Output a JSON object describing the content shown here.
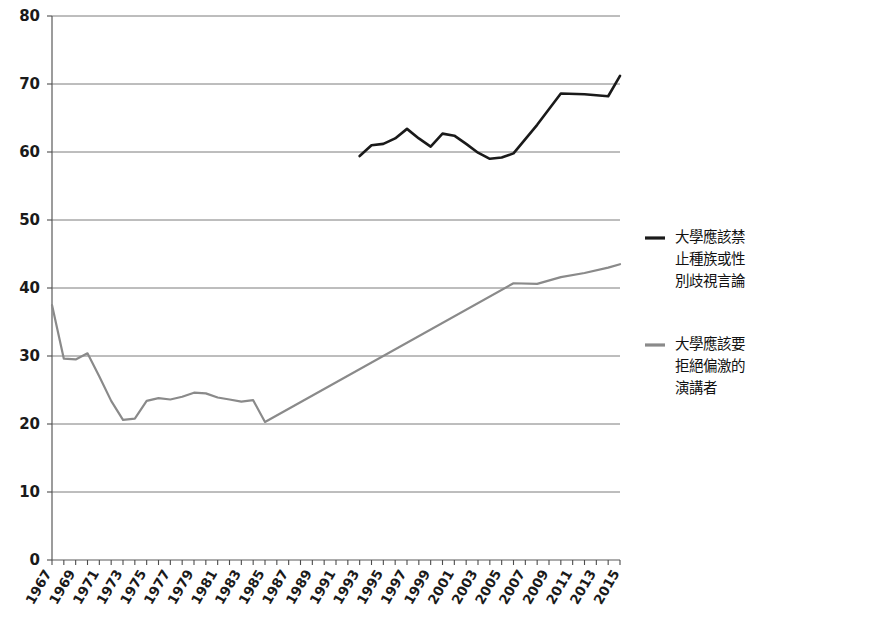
{
  "chart_data": {
    "type": "line",
    "title": "",
    "subtitle": "",
    "xlabel": "",
    "ylabel": "",
    "xlim": [
      1967,
      2015
    ],
    "ylim": [
      0,
      80
    ],
    "grid": true,
    "legend_position": "right",
    "y_ticks": [
      0,
      10,
      20,
      30,
      40,
      50,
      60,
      70,
      80
    ],
    "y_tick_labels": [
      "0",
      "10",
      "20",
      "30",
      "40",
      "50",
      "60",
      "70",
      "80"
    ],
    "x_ticks": [
      1967,
      1969,
      1971,
      1973,
      1975,
      1977,
      1979,
      1981,
      1983,
      1985,
      1987,
      1989,
      1991,
      1993,
      1995,
      1997,
      1999,
      2001,
      2003,
      2005,
      2007,
      2009,
      2011,
      2013,
      2015
    ],
    "x_tick_labels": [
      "1967",
      "1969",
      "1971",
      "1973",
      "1975",
      "1977",
      "1979",
      "1981",
      "1983",
      "1985",
      "1987",
      "1989",
      "1991",
      "1993",
      "1995",
      "1997",
      "1999",
      "2001",
      "2003",
      "2005",
      "2007",
      "2009",
      "2011",
      "2013",
      "2015"
    ],
    "x_minor_ticks": [
      1967,
      1968,
      1969,
      1970,
      1971,
      1972,
      1973,
      1974,
      1975,
      1976,
      1977,
      1978,
      1979,
      1980,
      1981,
      1982,
      1983,
      1984,
      1985,
      1986,
      1987,
      1988,
      1989,
      1990,
      1991,
      1992,
      1993,
      1994,
      1995,
      1996,
      1997,
      1998,
      1999,
      2000,
      2001,
      2002,
      2003,
      2004,
      2005,
      2006,
      2007,
      2008,
      2009,
      2010,
      2011,
      2012,
      2013,
      2014,
      2015
    ],
    "series": [
      {
        "name": "大學應該禁止種族或性別歧視言論",
        "color": "#1a1a1a",
        "width": 2.6,
        "x": [
          1993,
          1994,
          1995,
          1996,
          1997,
          1998,
          1999,
          2000,
          2001,
          2002,
          2003,
          2004,
          2005,
          2006,
          2008,
          2010,
          2012,
          2014,
          2015
        ],
        "values": [
          59.4,
          61.0,
          61.2,
          62.0,
          63.4,
          62.0,
          60.8,
          62.7,
          62.4,
          61.2,
          59.9,
          59.0,
          59.2,
          59.8,
          64.0,
          68.6,
          68.5,
          68.2,
          71.2
        ]
      },
      {
        "name": "大學應該要拒絕偏激的演講者",
        "color": "#8a8a8a",
        "width": 2.2,
        "x": [
          1967,
          1968,
          1969,
          1970,
          1971,
          1972,
          1973,
          1974,
          1975,
          1976,
          1977,
          1978,
          1979,
          1980,
          1981,
          1982,
          1983,
          1984,
          1985,
          2006,
          2008,
          2010,
          2012,
          2014,
          2015
        ],
        "values": [
          37.5,
          29.6,
          29.5,
          30.4,
          27.0,
          23.4,
          20.6,
          20.8,
          23.4,
          23.8,
          23.6,
          24.0,
          24.6,
          24.5,
          23.9,
          23.6,
          23.3,
          23.5,
          20.3,
          40.7,
          40.6,
          41.6,
          42.2,
          43.0,
          43.5
        ]
      }
    ],
    "legend": [
      {
        "label_lines": [
          "大學應該禁",
          "止種族或性",
          "別歧視言論"
        ],
        "color": "#1a1a1a"
      },
      {
        "label_lines": [
          "大學應該要",
          "拒絕偏激的",
          "演講者"
        ],
        "color": "#8a8a8a"
      }
    ]
  },
  "layout": {
    "plot_left": 52,
    "plot_right": 620,
    "plot_top": 16,
    "plot_bottom": 560,
    "legend_x": 645,
    "legend_row1_y": 238,
    "legend_row2_y": 345,
    "legend_line_height": 22,
    "legend_swatch_len": 20,
    "legend_text_gap": 10
  }
}
